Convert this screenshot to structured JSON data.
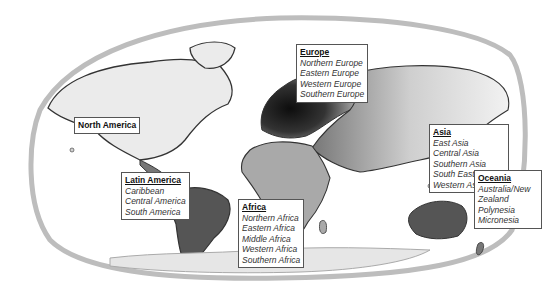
{
  "map": {
    "title": "World regions",
    "colors": {
      "ocean": "#ffffff",
      "frame": "#bdbdbd",
      "land_light": "#ebebeb",
      "land_mid": "#a9a9a9",
      "land_dark": "#555555",
      "europe": "#1a1a1a",
      "outline": "#333333"
    }
  },
  "regions": [
    {
      "id": "europe",
      "title": "Europe",
      "underlined": true,
      "subregions": [
        "Northern Europe",
        "Eastern Europe",
        "Western Europe",
        "Southern Europe"
      ]
    },
    {
      "id": "asia",
      "title": "Asia",
      "underlined": true,
      "subregions": [
        "East Asia",
        "Central Asia",
        "Southern Asia",
        "South Eastern Asia",
        "Western Asia"
      ]
    },
    {
      "id": "north-america",
      "title": "North America",
      "underlined": false,
      "subregions": []
    },
    {
      "id": "latin-america",
      "title": "Latin America",
      "underlined": true,
      "subregions": [
        "Caribbean",
        "Central America",
        "South America"
      ]
    },
    {
      "id": "africa",
      "title": "Africa",
      "underlined": true,
      "subregions": [
        "Northern Africa",
        "Eastern Africa",
        "Middle Africa",
        "Western Africa",
        "Southern Africa"
      ]
    },
    {
      "id": "oceania",
      "title": "Oceania",
      "underlined": true,
      "subregions": [
        "Australia/New Zealand",
        "Polynesia",
        "Micronesia"
      ]
    }
  ]
}
